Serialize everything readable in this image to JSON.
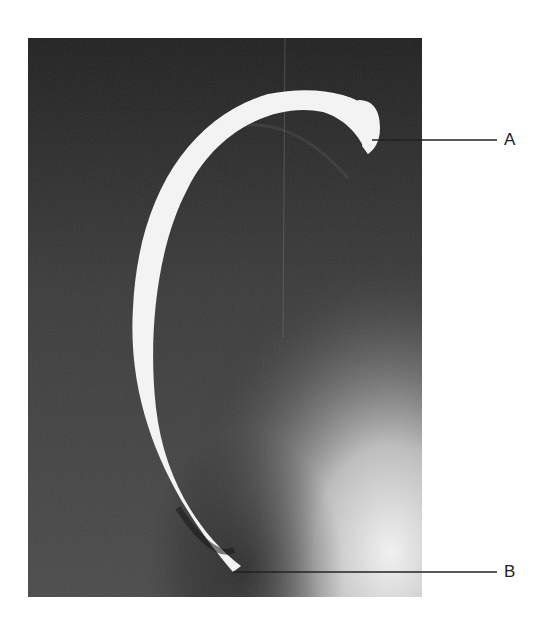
{
  "figure": {
    "labels": [
      {
        "id": "A",
        "text": "A",
        "points_to": "hooked head end at top right of the bone"
      },
      {
        "id": "B",
        "text": "B",
        "points_to": "lower end of the bone shaft"
      }
    ],
    "colors": {
      "background": "#ffffff",
      "photo_dark": "#2a2a2a",
      "photo_light": "#e8e8e8",
      "bone": "#f2f2f2",
      "leader_line": "#222222"
    }
  }
}
